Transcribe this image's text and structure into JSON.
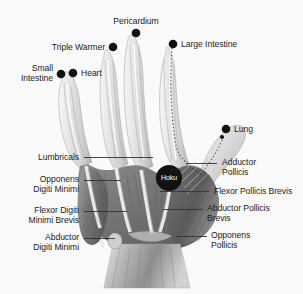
{
  "figure": {
    "background_color": "#fafafa",
    "label_color": "#1a1a1a",
    "marker_color": "#111111",
    "leader_color": "#333333"
  },
  "meridian_points": [
    {
      "id": "pericardium",
      "label": "Pericardium",
      "dot": {
        "x": 136,
        "y": 33
      },
      "text": {
        "x": 136,
        "y": 16,
        "align": "c"
      }
    },
    {
      "id": "triple-warmer",
      "label": "Triple Warmer",
      "dot": {
        "x": 113,
        "y": 47
      },
      "text": {
        "x": 105,
        "y": 42,
        "align": "r"
      }
    },
    {
      "id": "large-intestine",
      "label": "Large Intestine",
      "dot": {
        "x": 173,
        "y": 44
      },
      "text": {
        "x": 181,
        "y": 39,
        "align": "l"
      }
    },
    {
      "id": "heart",
      "label": "Heart",
      "dot": {
        "x": 73,
        "y": 73
      },
      "text": {
        "x": 81,
        "y": 68,
        "align": "l"
      }
    },
    {
      "id": "small-intestine",
      "label": "Small\nIntestine",
      "dot": {
        "x": 61,
        "y": 74
      },
      "text": {
        "x": 53,
        "y": 63,
        "align": "r"
      }
    },
    {
      "id": "lung",
      "label": "Lung",
      "dot": {
        "x": 226,
        "y": 129
      },
      "text": {
        "x": 234,
        "y": 124,
        "align": "l"
      }
    }
  ],
  "muscle_labels": [
    {
      "id": "lumbricals",
      "label": "Lumbricals",
      "text": {
        "x": 79,
        "y": 152,
        "align": "r"
      },
      "leader": {
        "x1": 84,
        "y1": 157,
        "x2": 153,
        "y2": 157
      }
    },
    {
      "id": "opponens-digiti-minimi",
      "label": "Opponens\nDigiti Minimi",
      "text": {
        "x": 79,
        "y": 174,
        "align": "r"
      },
      "leader": {
        "x1": 84,
        "y1": 180,
        "x2": 121,
        "y2": 180
      }
    },
    {
      "id": "flexor-digiti-minimi-brevis",
      "label": "Flexor Digiti\nMinimi Brevis",
      "text": {
        "x": 79,
        "y": 205,
        "align": "r"
      },
      "leader": {
        "x1": 84,
        "y1": 211,
        "x2": 127,
        "y2": 211
      }
    },
    {
      "id": "abductor-digiti-minimi",
      "label": "Abductor\nDigiti Minimi",
      "text": {
        "x": 79,
        "y": 232,
        "align": "r"
      },
      "leader": {
        "x1": 84,
        "y1": 238,
        "x2": 115,
        "y2": 238
      }
    },
    {
      "id": "adductor-pollicis",
      "label": "Adductor\nPollicis",
      "text": {
        "x": 222,
        "y": 157,
        "align": "l"
      },
      "leader": {
        "x1": 186,
        "y1": 163,
        "x2": 217,
        "y2": 163
      }
    },
    {
      "id": "flexor-pollicis-brevis",
      "label": "Flexor Pollicis Brevis",
      "text": {
        "x": 214,
        "y": 186,
        "align": "l"
      },
      "leader": {
        "x1": 160,
        "y1": 191,
        "x2": 209,
        "y2": 191
      }
    },
    {
      "id": "abductor-pollicis-brevis",
      "label": "Abductor Pollicis\nBrevis",
      "text": {
        "x": 207,
        "y": 203,
        "align": "l"
      },
      "leader": {
        "x1": 163,
        "y1": 209,
        "x2": 203,
        "y2": 209
      }
    },
    {
      "id": "opponens-pollicis",
      "label": "Opponens\nPollicis",
      "text": {
        "x": 211,
        "y": 230,
        "align": "l"
      },
      "leader": {
        "x1": 176,
        "y1": 236,
        "x2": 207,
        "y2": 236
      }
    }
  ],
  "acupoint_badge": {
    "id": "hoku",
    "label": "Hoku",
    "center": {
      "x": 169,
      "y": 178
    },
    "radius": 13,
    "fill": "#121212",
    "text_color": "#ffffff"
  }
}
